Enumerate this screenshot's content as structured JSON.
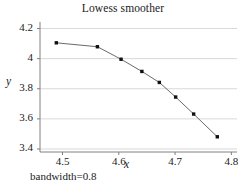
{
  "chart_data": {
    "type": "line",
    "title": "Lowess smoother",
    "xlabel": "x",
    "ylabel": "y",
    "caption": "bandwidth=0.8",
    "xlim": [
      4.46,
      4.81
    ],
    "ylim": [
      3.38,
      4.23
    ],
    "xticks": [
      4.5,
      4.6,
      4.7,
      4.8
    ],
    "xtick_labels": [
      "4.5",
      "4.6",
      "4.7",
      "4.8"
    ],
    "yticks": [
      3.4,
      3.6,
      3.8,
      4.0,
      4.2
    ],
    "ytick_labels": [
      "3.4",
      "3.6",
      "3.8",
      "4",
      "4.2"
    ],
    "grid": "horizontal",
    "legend": "none",
    "marker": "filled-square",
    "series": [
      {
        "name": "lowess",
        "x": [
          4.489,
          4.562,
          4.604,
          4.641,
          4.672,
          4.701,
          4.733,
          4.775
        ],
        "y": [
          4.105,
          4.079,
          3.996,
          3.915,
          3.842,
          3.745,
          3.632,
          3.481
        ]
      }
    ],
    "colors": {
      "line": "#595959",
      "marker": "#101010",
      "grid": "#d9d9d9",
      "axis": "#808080",
      "text": "#1a1a1a",
      "background": "#ffffff"
    }
  }
}
